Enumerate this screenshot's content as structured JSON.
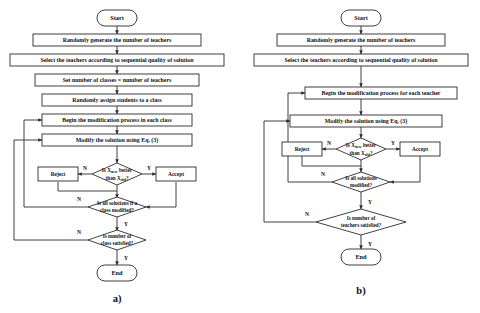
{
  "figure": {
    "background": "#ffffff",
    "line_color": "#2b2b2b",
    "text_color": "#111111",
    "captions": {
      "left": "a)",
      "right": "b)"
    }
  },
  "labels": {
    "yes": "Y",
    "no": "N"
  },
  "panel_a": {
    "caption": "a)",
    "nodes": {
      "start": "Start",
      "generate_teachers": "Randomly generate the number of teachers",
      "select_teachers": "Select the teachers according to sequential quality of solution",
      "set_classes": "Set number of classes = number of teachers",
      "assign_students": "Randomly assign students to a class",
      "begin_modification": "Begin the modification process in each class",
      "modify_solution": "Modify the solution using Eq. (3)",
      "reject": "Reject",
      "accept": "Accept",
      "decision_better_line1": "Is X",
      "decision_better_sub1": "new",
      "decision_better_line1b": " better",
      "decision_better_line2": "than X",
      "decision_better_sub2": "old",
      "decision_better_line2b": "?",
      "decision_all_modified_line1": "Is all solutions if a",
      "decision_all_modified_line2": "class modified?",
      "decision_number_line1": "Is number of",
      "decision_number_line2": "class satisfied?",
      "end": "End"
    }
  },
  "panel_b": {
    "caption": "b)",
    "nodes": {
      "start": "Start",
      "generate_teachers": "Randomly generate the number of teachers",
      "select_teachers": "Select the teachers according to sequential quality of solution",
      "begin_modification": "Begin the modification process for each teacher",
      "modify_solution": "Modify the solution using Eq. (3)",
      "reject": "Reject",
      "accept": "Accept",
      "decision_better_line1": "Is X",
      "decision_better_sub1": "new",
      "decision_better_line1b": " better",
      "decision_better_line2": "than X",
      "decision_better_sub2": "old",
      "decision_better_line2b": "?",
      "decision_all_modified_line1": "Is all solutions",
      "decision_all_modified_line2": "modified?",
      "decision_number_line1": "Is number of",
      "decision_number_line2": "teachers satisfied?",
      "end": "End"
    }
  }
}
